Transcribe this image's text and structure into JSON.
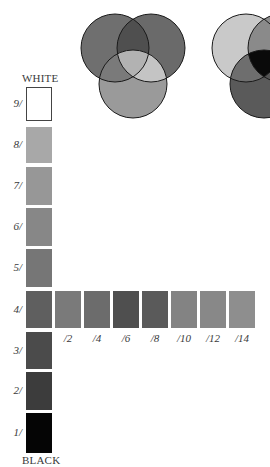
{
  "venn_diagrams": [
    {
      "name": "additive-venn",
      "circles": [
        {
          "cx": 115,
          "cy": 48,
          "r": 34,
          "fill": "#6f6f6f"
        },
        {
          "cx": 151,
          "cy": 48,
          "r": 34,
          "fill": "#6a6a6a"
        },
        {
          "cx": 133,
          "cy": 84,
          "r": 34,
          "fill": "#9a9a9a"
        }
      ],
      "overlaps": {
        "top": "#4f4f4f",
        "left_bottom": "#7a7a7a",
        "right_bottom": "#c4c4c4",
        "center": "#b2b2b2"
      }
    },
    {
      "name": "subtractive-venn",
      "circles": [
        {
          "cx": 246,
          "cy": 48,
          "r": 34,
          "fill": "#c9c9c9"
        },
        {
          "cx": 282,
          "cy": 48,
          "r": 34,
          "fill": "#8c8c8c"
        },
        {
          "cx": 264,
          "cy": 84,
          "r": 34,
          "fill": "#5a5a5a"
        }
      ],
      "overlaps": {
        "center": "#0a0a0a",
        "left_bottom": "#6e6e6e"
      }
    }
  ],
  "value_scale": {
    "top_label": "WHITE",
    "bottom_label": "BLACK",
    "swatches": [
      {
        "label": "9/",
        "y": 87,
        "h": 34,
        "color": "#ffffff",
        "outlined": true
      },
      {
        "label": "8/",
        "y": 127,
        "h": 36,
        "color": "#a8a8a8"
      },
      {
        "label": "7/",
        "y": 167,
        "h": 38,
        "color": "#979797"
      },
      {
        "label": "6/",
        "y": 208,
        "h": 38,
        "color": "#878787"
      },
      {
        "label": "5/",
        "y": 249,
        "h": 38,
        "color": "#767676"
      },
      {
        "label": "4/",
        "y": 291,
        "h": 37,
        "color": "#5f5f5f"
      },
      {
        "label": "3/",
        "y": 332,
        "h": 37,
        "color": "#4b4b4b"
      },
      {
        "label": "2/",
        "y": 372,
        "h": 38,
        "color": "#3c3c3c"
      },
      {
        "label": "1/",
        "y": 413,
        "h": 40,
        "color": "#050505"
      }
    ]
  },
  "chroma_scale": {
    "y": 291,
    "h": 37,
    "swatches": [
      {
        "label": "/2",
        "x": 55,
        "color": "#7a7a7a"
      },
      {
        "label": "/4",
        "x": 84,
        "color": "#6c6c6c"
      },
      {
        "label": "/6",
        "x": 113,
        "color": "#4f4f4f"
      },
      {
        "label": "/8",
        "x": 142,
        "color": "#5a5a5a"
      },
      {
        "label": "/10",
        "x": 171,
        "color": "#838383"
      },
      {
        "label": "/12",
        "x": 200,
        "color": "#888888"
      },
      {
        "label": "/14",
        "x": 229,
        "color": "#8e8e8e"
      }
    ]
  }
}
